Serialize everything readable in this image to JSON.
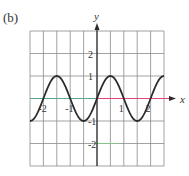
{
  "panel_label": "(b)",
  "chart_data": {
    "type": "line",
    "title": "",
    "function": "y = sin(pi x)",
    "xlabel": "x",
    "ylabel": "y",
    "xlim": [
      -2.5,
      2.5
    ],
    "ylim": [
      -3,
      3
    ],
    "grid": true,
    "grid_x_step": 0.5,
    "grid_y_step": 1,
    "x_ticks": [
      {
        "value": -2,
        "label": "-2"
      },
      {
        "value": -1,
        "label": "-1"
      },
      {
        "value": 1,
        "label": "1"
      },
      {
        "value": 2,
        "label": "2"
      }
    ],
    "y_ticks": [
      {
        "value": 2,
        "label": "2"
      },
      {
        "value": 1,
        "label": "1"
      },
      {
        "value": -1,
        "label": "-1"
      },
      {
        "value": -2,
        "label": "-2"
      }
    ],
    "series": [
      {
        "name": "sin(pi x)",
        "color": "#2b2b2b",
        "x": [
          -2.5,
          -2,
          -1.5,
          -1,
          -0.5,
          0,
          0.5,
          1,
          1.5,
          2,
          2.5
        ],
        "y": [
          -1,
          0,
          1,
          0,
          -1,
          0,
          1,
          0,
          -1,
          0,
          1
        ]
      }
    ],
    "colors": {
      "grid": "#8a8a8a",
      "axis": "#2b2b2b",
      "x_axis_negative": "#5aa88a",
      "x_axis_positive": "#e0447a",
      "y_minus2_line_highlight": "#7fd07f"
    }
  }
}
